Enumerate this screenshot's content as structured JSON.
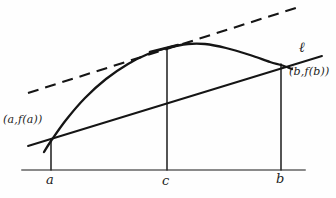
{
  "figure": {
    "background_color": "#fefefe",
    "ink_color": "#1c1c1c",
    "axis_color": "#8a8a8a"
  },
  "labels": {
    "point_a": "(a,f(a))",
    "point_b": "(b,f(b))",
    "secant_line": "ℓ",
    "axis_a": "a",
    "axis_c": "c",
    "axis_b": "b"
  },
  "chart_data": {
    "type": "line",
    "xlabel": "",
    "ylabel": "",
    "grid": false,
    "legend": "none",
    "axis": {
      "baseline_y": 170,
      "x_start": 22,
      "x_end": 305,
      "ticks": [
        {
          "label": "a",
          "x": 51
        },
        {
          "label": "c",
          "x": 167
        },
        {
          "label": "b",
          "x": 281
        }
      ]
    },
    "curve": {
      "name": "f(x)",
      "style": "solid",
      "points": [
        {
          "x": 44,
          "y": 152
        },
        {
          "x": 51,
          "y": 141
        },
        {
          "x": 66,
          "y": 120
        },
        {
          "x": 85,
          "y": 98
        },
        {
          "x": 106,
          "y": 79
        },
        {
          "x": 128,
          "y": 64
        },
        {
          "x": 148,
          "y": 54
        },
        {
          "x": 167,
          "y": 48
        },
        {
          "x": 188,
          "y": 44
        },
        {
          "x": 205,
          "y": 44
        },
        {
          "x": 226,
          "y": 48
        },
        {
          "x": 250,
          "y": 55
        },
        {
          "x": 270,
          "y": 62
        },
        {
          "x": 281,
          "y": 65
        },
        {
          "x": 292,
          "y": 69
        }
      ]
    },
    "secant_line": {
      "name": "ℓ",
      "style": "solid",
      "through": [
        "(a,f(a))",
        "(b,f(b))"
      ],
      "x1": 28,
      "y1": 146,
      "x2": 322,
      "y2": 56
    },
    "tangent_line": {
      "name": "tangent at c",
      "style": "dashed",
      "parallel_to": "ℓ",
      "x1": 28,
      "y1": 93,
      "x2": 302,
      "y2": 6
    },
    "drop_lines": [
      {
        "label": "a",
        "x": 51,
        "y_top": 141,
        "y_bottom": 170
      },
      {
        "label": "c",
        "x": 167,
        "y_top": 48,
        "y_bottom": 170
      },
      {
        "label": "b",
        "x": 281,
        "y_top": 64,
        "y_bottom": 170
      }
    ],
    "annotations": [
      {
        "text": "(a,f(a))",
        "x": 3,
        "y": 114
      },
      {
        "text": "(b,f(b))",
        "x": 289,
        "y": 66
      },
      {
        "text": "ℓ",
        "x": 299,
        "y": 40
      }
    ]
  }
}
